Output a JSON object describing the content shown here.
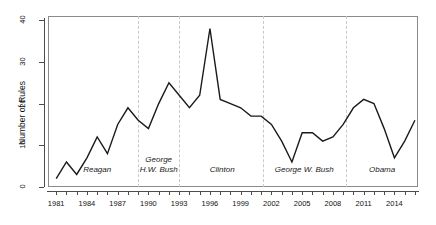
{
  "chart_data": {
    "type": "line",
    "title": "",
    "xlabel": "",
    "ylabel": "Number of Rules",
    "xlim": [
      1980.2,
      2016.3
    ],
    "ylim": [
      0,
      41
    ],
    "grid": false,
    "legend": "none",
    "yticks": [
      0,
      10,
      20,
      30,
      40
    ],
    "ytick_labels": [
      "0",
      "10",
      "20",
      "30",
      "40"
    ],
    "xticks": [
      1981,
      1982,
      1983,
      1984,
      1985,
      1986,
      1987,
      1988,
      1989,
      1990,
      1991,
      1992,
      1993,
      1994,
      1995,
      1996,
      1997,
      1998,
      1999,
      2000,
      2001,
      2002,
      2003,
      2004,
      2005,
      2006,
      2007,
      2008,
      2009,
      2010,
      2011,
      2012,
      2013,
      2014,
      2015,
      2016
    ],
    "xtick_labels": [
      "1981",
      "1984",
      "1987",
      "1990",
      "1993",
      "1996",
      "1999",
      "2002",
      "2005",
      "2008",
      "2011",
      "2014"
    ],
    "xtick_label_years": [
      1981,
      1984,
      1987,
      1990,
      1993,
      1996,
      1999,
      2002,
      2005,
      2008,
      2011,
      2014
    ],
    "x": [
      1981,
      1982,
      1983,
      1984,
      1985,
      1986,
      1987,
      1988,
      1989,
      1990,
      1991,
      1992,
      1993,
      1994,
      1995,
      1996,
      1997,
      1998,
      1999,
      2000,
      2001,
      2002,
      2003,
      2004,
      2005,
      2006,
      2007,
      2008,
      2009,
      2010,
      2011,
      2012,
      2013,
      2014,
      2015,
      2016
    ],
    "values": [
      2,
      6,
      3,
      7,
      12,
      8,
      15,
      19,
      16,
      14,
      20,
      25,
      22,
      19,
      22,
      38,
      21,
      20,
      19,
      17,
      17,
      15,
      11,
      6,
      13,
      13,
      11,
      12,
      15,
      19,
      21,
      20,
      14,
      7,
      11,
      16
    ],
    "series_name": "Number of Rules",
    "line_color": "#1a1a1a",
    "divider_color": "#c9c9c9",
    "annotations": [
      {
        "label": "Reagan",
        "year_center": 1985.0,
        "boundary_year": 1989.0
      },
      {
        "label": "George\nH.W. Bush",
        "year_center": 1991.0,
        "boundary_year": 1993.0
      },
      {
        "label": "Clinton",
        "year_center": 1997.2,
        "boundary_year": 2001.2
      },
      {
        "label": "George W. Bush",
        "year_center": 2005.2,
        "boundary_year": 2009.3
      },
      {
        "label": "Obama",
        "year_center": 2012.8,
        "boundary_year": null
      }
    ],
    "divider_years": [
      1989.0,
      1993.0,
      2001.2,
      2009.3
    ]
  }
}
